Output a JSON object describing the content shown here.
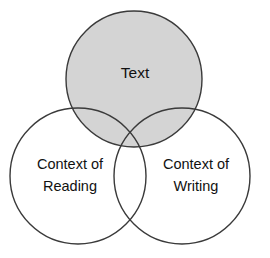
{
  "diagram": {
    "type": "venn",
    "background_color": "#ffffff",
    "stroke_color": "#3a3a3a",
    "text_color": "#111111",
    "shaded_fill": "#d4d4d4",
    "unshaded_fill": "none",
    "circles": [
      {
        "id": "text",
        "label": "Text",
        "label_lines": [
          "Text"
        ],
        "cx": 134,
        "cy": 79,
        "r": 68,
        "fill": "#d4d4d4",
        "shaded": true
      },
      {
        "id": "context-of-reading",
        "label": "Context of Reading",
        "label_lines": [
          "Context of",
          "Reading"
        ],
        "cx": 78,
        "cy": 176,
        "r": 68,
        "fill": "none",
        "shaded": false
      },
      {
        "id": "context-of-writing",
        "label": "Context of Writing",
        "label_lines": [
          "Context of",
          "Writing"
        ],
        "cx": 182,
        "cy": 176,
        "r": 68,
        "fill": "none",
        "shaded": false
      }
    ],
    "labels": {
      "text_line1": "Text",
      "reading_line1": "Context of",
      "reading_line2": "Reading",
      "writing_line1": "Context of",
      "writing_line2": "Writing"
    }
  }
}
